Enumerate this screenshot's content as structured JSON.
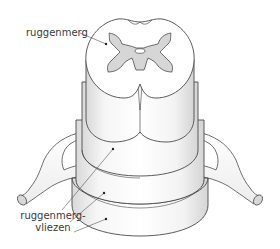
{
  "diagram": {
    "labels": {
      "spinal_cord": "ruggenmerg",
      "meninges_line1": "ruggenmerg-",
      "meninges_line2": "vliezen"
    },
    "colors": {
      "outline": "#4a4a4a",
      "grey_matter": "#d6d6d6",
      "white_matter": "#ffffff",
      "meninges_shade": "#e4e4e4",
      "leader_line": "#555555",
      "text": "#3a3a3a"
    }
  }
}
